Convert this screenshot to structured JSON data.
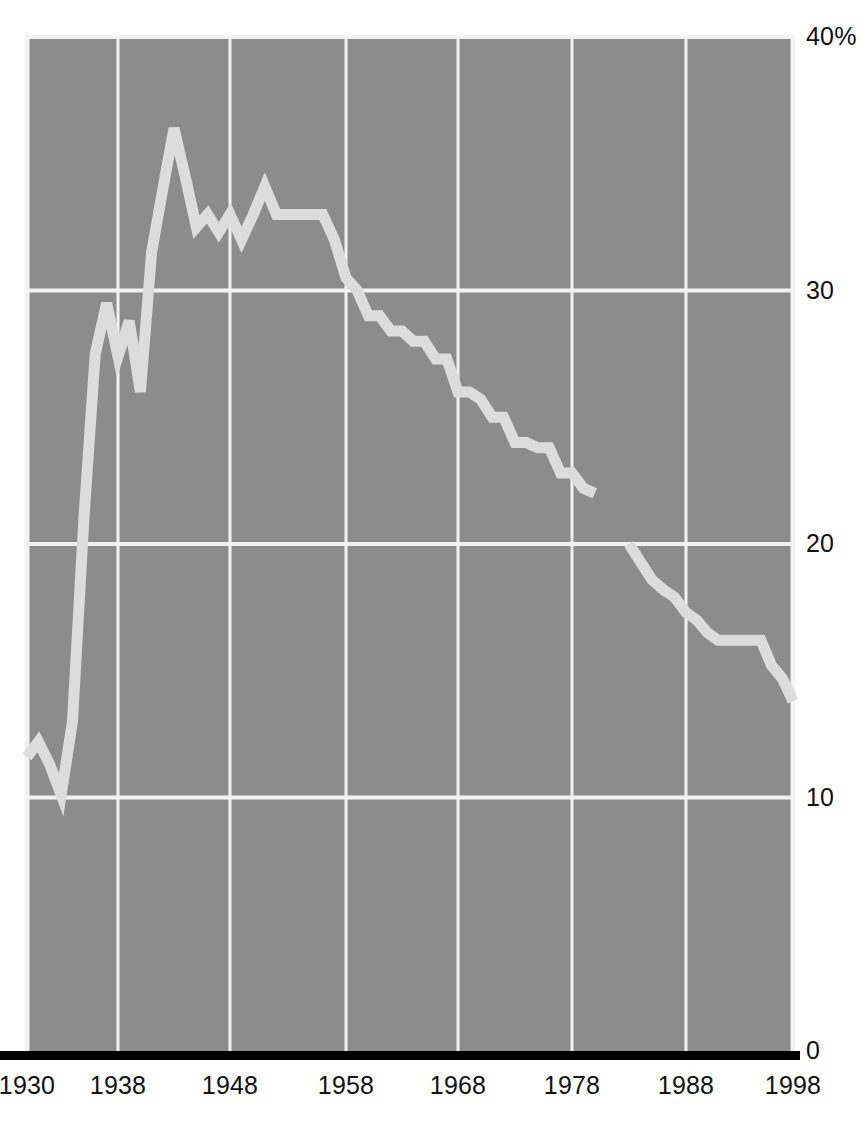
{
  "chart_data": {
    "type": "line",
    "title": "",
    "subtitle": "",
    "xlabel": "",
    "ylabel": "",
    "xlim": [
      1930,
      1998
    ],
    "ylim": [
      0,
      40
    ],
    "grid": true,
    "legend": null,
    "annotations": [],
    "x_ticks": [
      "1930",
      "1938",
      "1948",
      "1958",
      "1968",
      "1978",
      "1988",
      "1998"
    ],
    "x_tick_values": [
      1930,
      1938,
      1948,
      1958,
      1968,
      1978,
      1988,
      1998
    ],
    "y_ticks": [
      "0",
      "10",
      "20",
      "30",
      "40%"
    ],
    "y_tick_values": [
      0,
      10,
      20,
      30,
      40
    ],
    "colors": {
      "plot_background": "#8c8c8c",
      "gridline": "#f2f2f2",
      "line": "#dcdcdc",
      "axis": "#000000",
      "page_background": "#ffffff",
      "text": "#111111"
    },
    "series": [
      {
        "name": "segment-1",
        "x": [
          1930,
          1931,
          1932,
          1933,
          1934,
          1935,
          1936,
          1937,
          1938,
          1939,
          1940,
          1941,
          1942,
          1943,
          1944,
          1945,
          1946,
          1947,
          1948,
          1949,
          1950,
          1951,
          1952,
          1953,
          1954,
          1955,
          1956,
          1957,
          1958,
          1959,
          1960,
          1961,
          1962,
          1963,
          1964,
          1965,
          1966,
          1967,
          1968,
          1969,
          1970,
          1971,
          1972,
          1973,
          1974,
          1975,
          1976,
          1977,
          1978,
          1979,
          1980
        ],
        "y": [
          11.6,
          12.2,
          11.3,
          10.1,
          13.0,
          21.0,
          27.5,
          29.5,
          27.4,
          28.8,
          26.0,
          31.5,
          34.0,
          36.4,
          34.5,
          32.5,
          33.0,
          32.3,
          33.0,
          32.0,
          33.0,
          34.1,
          33.0,
          33.0,
          33.0,
          33.0,
          33.0,
          32.0,
          30.5,
          30.0,
          29.0,
          29.0,
          28.4,
          28.4,
          28.0,
          28.0,
          27.3,
          27.3,
          26.0,
          26.0,
          25.7,
          25.0,
          25.0,
          24.0,
          24.0,
          23.8,
          23.8,
          22.8,
          22.8,
          22.2,
          22.0
        ]
      },
      {
        "name": "segment-2",
        "x": [
          1983,
          1984,
          1985,
          1986,
          1987,
          1988,
          1989,
          1990,
          1991,
          1992,
          1993,
          1994,
          1995,
          1996,
          1997,
          1998
        ],
        "y": [
          20.0,
          19.3,
          18.6,
          18.2,
          17.9,
          17.3,
          17.0,
          16.5,
          16.2,
          16.2,
          16.2,
          16.2,
          16.2,
          15.2,
          14.7,
          13.8
        ]
      }
    ]
  }
}
